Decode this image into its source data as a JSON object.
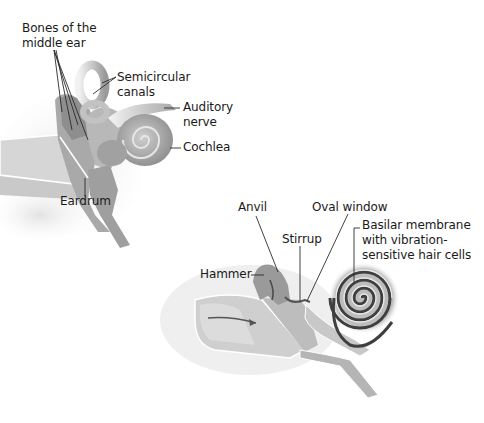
{
  "diagram": {
    "type": "anatomical-illustration",
    "panels": [
      {
        "id": "overview",
        "labels": {
          "bones": {
            "line1": "Bones of the",
            "line2": "middle ear"
          },
          "semicircular": {
            "line1": "Semicircular",
            "line2": "canals"
          },
          "auditory": {
            "line1": "Auditory",
            "line2": "nerve"
          },
          "cochlea": "Cochlea",
          "eardrum": "Eardrum"
        }
      },
      {
        "id": "detail",
        "labels": {
          "anvil": "Anvil",
          "oval_window": "Oval window",
          "stirrup": "Stirrup",
          "hammer": "Hammer",
          "basilar": {
            "line1": "Basilar membrane",
            "line2": "with vibration-",
            "line3": "sensitive hair cells"
          }
        }
      }
    ],
    "colors": {
      "tissue_light": "#d9d9d9",
      "tissue_mid": "#b3b3b3",
      "tissue_dark": "#7a7a7a",
      "leader_line": "#333333",
      "bone_texture": "#e8e8e8"
    }
  }
}
